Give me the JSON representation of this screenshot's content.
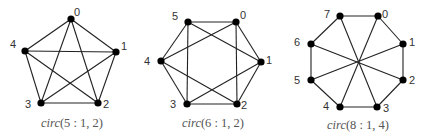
{
  "figure": {
    "graphs": [
      {
        "id": "circ-5-1-2",
        "caption_name": "circ",
        "caption_args": "(5 : 1, 2)",
        "nodes": [
          {
            "label": "0",
            "x": 71,
            "y": 19,
            "lx": 77,
            "ly": 16
          },
          {
            "label": "1",
            "x": 116,
            "y": 52,
            "lx": 124,
            "ly": 50
          },
          {
            "label": "2",
            "x": 98,
            "y": 103,
            "lx": 106,
            "ly": 108
          },
          {
            "label": "3",
            "x": 41,
            "y": 103,
            "lx": 28,
            "ly": 108
          },
          {
            "label": "4",
            "x": 25,
            "y": 51,
            "lx": 13,
            "ly": 48
          }
        ],
        "edges": [
          [
            0,
            1
          ],
          [
            1,
            2
          ],
          [
            2,
            3
          ],
          [
            3,
            4
          ],
          [
            4,
            0
          ],
          [
            0,
            2
          ],
          [
            0,
            3
          ],
          [
            1,
            3
          ],
          [
            1,
            4
          ],
          [
            2,
            4
          ]
        ],
        "caption_x": 72,
        "caption_y": 127
      },
      {
        "id": "circ-6-1-2",
        "caption_name": "circ",
        "caption_args": "(6 : 1, 2)",
        "nodes": [
          {
            "label": "0",
            "x": 236,
            "y": 22,
            "lx": 243,
            "ly": 19
          },
          {
            "label": "1",
            "x": 261,
            "y": 62,
            "lx": 269,
            "ly": 64
          },
          {
            "label": "2",
            "x": 237,
            "y": 104,
            "lx": 244,
            "ly": 109
          },
          {
            "label": "3",
            "x": 187,
            "y": 104,
            "lx": 173,
            "ly": 108
          },
          {
            "label": "4",
            "x": 161,
            "y": 61,
            "lx": 147,
            "ly": 65
          },
          {
            "label": "5",
            "x": 188,
            "y": 22,
            "lx": 175,
            "ly": 20
          }
        ],
        "edges": [
          [
            0,
            1
          ],
          [
            1,
            2
          ],
          [
            2,
            3
          ],
          [
            3,
            4
          ],
          [
            4,
            5
          ],
          [
            5,
            0
          ],
          [
            0,
            2
          ],
          [
            2,
            4
          ],
          [
            4,
            0
          ],
          [
            1,
            3
          ],
          [
            3,
            5
          ],
          [
            5,
            1
          ]
        ],
        "caption_x": 213,
        "caption_y": 127
      },
      {
        "id": "circ-8-1-4",
        "caption_name": "circ",
        "caption_args": "(8 : 1, 4)",
        "nodes": [
          {
            "label": "0",
            "x": 378,
            "y": 16,
            "lx": 385,
            "ly": 18
          },
          {
            "label": "1",
            "x": 403,
            "y": 44,
            "lx": 412,
            "ly": 46
          },
          {
            "label": "2",
            "x": 403,
            "y": 80,
            "lx": 412,
            "ly": 84
          },
          {
            "label": "3",
            "x": 377,
            "y": 107,
            "lx": 386,
            "ly": 112
          },
          {
            "label": "4",
            "x": 340,
            "y": 107,
            "lx": 326,
            "ly": 110
          },
          {
            "label": "5",
            "x": 311,
            "y": 80,
            "lx": 297,
            "ly": 84
          },
          {
            "label": "6",
            "x": 311,
            "y": 44,
            "lx": 297,
            "ly": 46
          },
          {
            "label": "7",
            "x": 340,
            "y": 16,
            "lx": 327,
            "ly": 18
          }
        ],
        "edges": [
          [
            0,
            1
          ],
          [
            1,
            2
          ],
          [
            2,
            3
          ],
          [
            3,
            4
          ],
          [
            4,
            5
          ],
          [
            5,
            6
          ],
          [
            6,
            7
          ],
          [
            7,
            0
          ],
          [
            0,
            4
          ],
          [
            1,
            5
          ],
          [
            2,
            6
          ],
          [
            3,
            7
          ]
        ],
        "caption_x": 358,
        "caption_y": 129
      }
    ],
    "colors": {
      "edge": "#222222",
      "node": "#000000",
      "label": "#333333",
      "caption": "#555555",
      "background": "#ffffff"
    }
  }
}
